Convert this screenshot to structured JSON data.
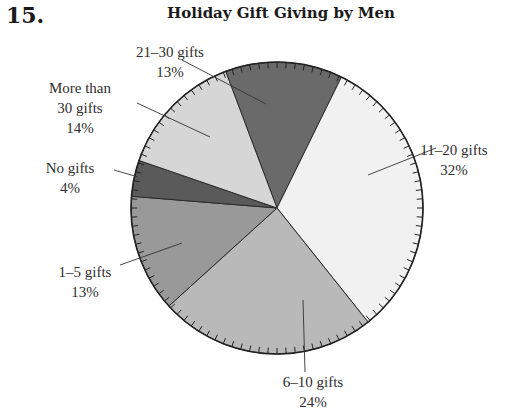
{
  "problem_number": "15.",
  "chart_data": {
    "type": "pie",
    "title": "Holiday Gift Giving by Men",
    "start_angle_deg": 339.4,
    "slices": [
      {
        "label": "21–30 gifts",
        "value": 13,
        "pct": "13%",
        "color": "#6a6a6a"
      },
      {
        "label": "11–20 gifts",
        "value": 32,
        "pct": "32%",
        "color": "#f1f1f1"
      },
      {
        "label": "6–10 gifts",
        "value": 24,
        "pct": "24%",
        "color": "#b9b9b9"
      },
      {
        "label": "1–5 gifts",
        "value": 13,
        "pct": "13%",
        "color": "#999999"
      },
      {
        "label": "No gifts",
        "value": 4,
        "pct": "4%",
        "color": "#5a5a5a"
      },
      {
        "label": "More than 30 gifts",
        "value": 14,
        "pct": "14%",
        "color": "#d6d6d6"
      }
    ]
  },
  "labels": {
    "s21_30": {
      "line1": "21–30 gifts",
      "line2": "13%"
    },
    "s11_20": {
      "line1": "11–20 gifts",
      "line2": "32%"
    },
    "s6_10": {
      "line1": "6–10 gifts",
      "line2": "24%"
    },
    "s1_5": {
      "line1": "1–5 gifts",
      "line2": "13%"
    },
    "none": {
      "line1": "No gifts",
      "line2": "4%"
    },
    "s30plus": {
      "line1": "More than",
      "line2": "30 gifts",
      "line3": "14%"
    }
  }
}
